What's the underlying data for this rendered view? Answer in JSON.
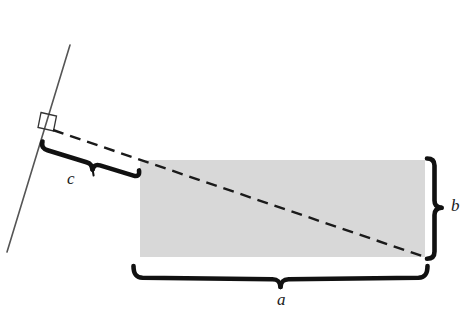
{
  "figure": {
    "colors": {
      "rectangle_fill": "#d8d8d8",
      "stroke": "#1a1a1a",
      "thin_line": "#555555"
    },
    "labels": {
      "a": "a",
      "b": "b",
      "c": "c"
    },
    "geometry": {
      "rectangle": {
        "x": 140,
        "y": 160,
        "width": 285,
        "height": 97
      },
      "slant_line": {
        "x1": 70,
        "y1": 45,
        "x2": 7,
        "y2": 252
      },
      "right_angle_marker": {
        "x": 40,
        "y": 112,
        "size": 15
      },
      "dashed_diagonal": {
        "x1": 53,
        "y1": 130,
        "x2": 425,
        "y2": 257
      },
      "brace_c": {
        "x1": 42,
        "y1": 146,
        "x2": 140,
        "y2": 176
      },
      "brace_b": {
        "x": 430,
        "y1": 158,
        "y2": 259
      },
      "brace_a": {
        "y": 280,
        "x1": 133,
        "x2": 427
      }
    },
    "label_positions": {
      "a": {
        "left": 277,
        "top": 291
      },
      "b": {
        "left": 451,
        "top": 197
      },
      "c": {
        "left": 67,
        "top": 170
      }
    }
  }
}
